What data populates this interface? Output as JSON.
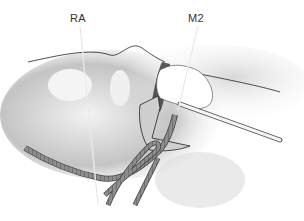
{
  "figure": {
    "type": "medical-illustration",
    "labels": [
      {
        "id": "RA",
        "text": "RA",
        "x": 70,
        "y": 12
      },
      {
        "id": "M2",
        "text": "M2",
        "x": 188,
        "y": 12
      }
    ],
    "colors": {
      "tissue_light": "#e6e6e6",
      "tissue_mid": "#bdbdbd",
      "tissue_dark": "#7a7a7a",
      "outline": "#222222",
      "sponge": "#ffffff",
      "vessel": "#8a8a8a",
      "background": "#ffffff"
    }
  }
}
